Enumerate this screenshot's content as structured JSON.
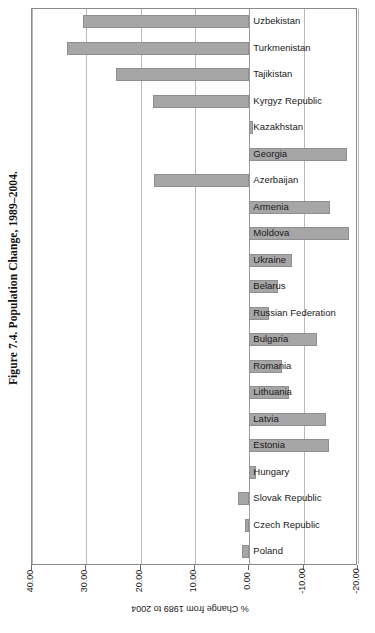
{
  "figure": {
    "caption": "Figure 7.4.  Population Change, 1989–2004.",
    "bar_color": "#a6a6a6",
    "bar_border_color": "#8f8f8f",
    "grid_color": "#b9b9b9",
    "frame_color": "#8a8a8a"
  },
  "axis": {
    "title": "% Change from 1989 to 2004",
    "ticks": [
      "40.00",
      "30.00",
      "20.00",
      "10.00",
      "0.00",
      "-10.00",
      "-20.00"
    ],
    "tick_values": [
      40,
      30,
      20,
      10,
      0,
      -10,
      -20
    ],
    "min": -20,
    "max": 40
  },
  "chart_data": {
    "type": "bar",
    "orientation": "horizontal",
    "title": "Figure 7.4.  Population Change, 1989–2004.",
    "xlabel": "% Change from 1989 to 2004",
    "ylabel": "",
    "xlim": [
      40,
      -20
    ],
    "axis_reversed": true,
    "grid": true,
    "legend": "none",
    "categories": [
      "Uzbekistan",
      "Turkmenistan",
      "Tajikistan",
      "Kyrgyz Republic",
      "Kazakhstan",
      "Georgia",
      "Azerbaijan",
      "Armenia",
      "Moldova",
      "Ukraine",
      "Belarus",
      "Russian Federation",
      "Bulgaria",
      "Romania",
      "Lithuania",
      "Latvia",
      "Estonia",
      "Hungary",
      "Slovak Republic",
      "Czech Republic",
      "Poland"
    ],
    "values": [
      30.6,
      33.5,
      24.5,
      17.7,
      -0.6,
      -17.9,
      17.6,
      -14.9,
      -18.3,
      -7.9,
      -5.2,
      -3.7,
      -12.5,
      -6.1,
      -7.3,
      -14.2,
      -14.6,
      -1.2,
      2.1,
      0.8,
      1.4
    ],
    "series": [
      {
        "name": "% Change from 1989 to 2004",
        "values": [
          30.6,
          33.5,
          24.5,
          17.7,
          -0.6,
          -17.9,
          17.6,
          -14.9,
          -18.3,
          -7.9,
          -5.2,
          -3.7,
          -12.5,
          -6.1,
          -7.3,
          -14.2,
          -14.6,
          -1.2,
          2.1,
          0.8,
          1.4
        ]
      }
    ]
  }
}
